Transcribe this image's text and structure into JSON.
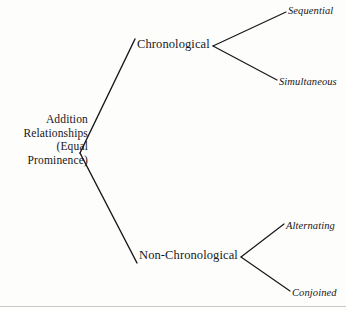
{
  "figure": {
    "type": "tree-diagram",
    "background_color": "#fdfdfc",
    "ink_color": "#17171a",
    "rule_color": "#c9c9c6"
  },
  "tree": {
    "root": {
      "lines": [
        "Addition",
        "Relationships",
        "(Equal",
        "Prominence)"
      ],
      "full_text": "Addition Relationships (Equal Prominence)",
      "style": "roman",
      "anchor_x": 80,
      "anchor_y": 153
    },
    "branches": [
      {
        "label": "Chronological",
        "style": "roman",
        "label_x": 137,
        "label_y": 45,
        "fork_x": 213,
        "fork_y": 46,
        "children": [
          {
            "label": "Sequential",
            "style": "italic",
            "label_x": 288,
            "label_y": 11
          },
          {
            "label": "Simultaneous",
            "style": "italic",
            "label_x": 279,
            "label_y": 82
          }
        ]
      },
      {
        "label": "Non-Chronological",
        "style": "roman",
        "label_x": 139,
        "label_y": 256,
        "fork_x": 241,
        "fork_y": 257,
        "children": [
          {
            "label": "Alternating",
            "style": "italic",
            "label_x": 286,
            "label_y": 226
          },
          {
            "label": "Conjoined",
            "style": "italic",
            "label_x": 292,
            "label_y": 293
          }
        ]
      }
    ]
  },
  "edges": [
    {
      "name": "root-to-chronological",
      "x1": 80,
      "y1": 153,
      "x2": 135,
      "y2": 39
    },
    {
      "name": "root-to-non-chronological",
      "x1": 80,
      "y1": 153,
      "x2": 137,
      "y2": 263
    },
    {
      "name": "chronological-to-sequential",
      "x1": 213,
      "y1": 46,
      "x2": 286,
      "y2": 12
    },
    {
      "name": "chronological-to-simultaneous",
      "x1": 213,
      "y1": 46,
      "x2": 277,
      "y2": 80
    },
    {
      "name": "non-chronological-to-alternating",
      "x1": 241,
      "y1": 257,
      "x2": 284,
      "y2": 224
    },
    {
      "name": "non-chronological-to-conjoined",
      "x1": 241,
      "y1": 257,
      "x2": 290,
      "y2": 291
    }
  ],
  "bottom_rule": {
    "y": 306
  }
}
